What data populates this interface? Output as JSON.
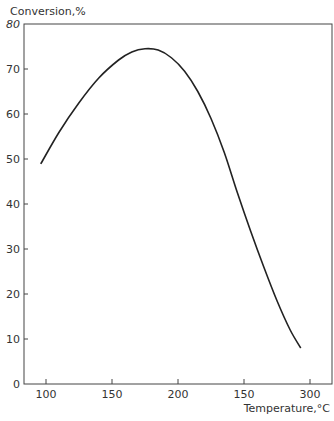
{
  "chart_data": {
    "type": "line",
    "title": "",
    "ylabel": "Conversion,%",
    "xlabel": "Temperature,°C",
    "ylim": [
      0,
      80
    ],
    "xlim": [
      85,
      315
    ],
    "y_ticks": [
      0,
      10,
      20,
      30,
      40,
      50,
      60,
      70,
      80
    ],
    "x_ticks": [
      100,
      150,
      200,
      250,
      300
    ],
    "x_tick_labels": [
      "100",
      "150",
      "200",
      "150",
      "300"
    ],
    "grid": false,
    "legend": null,
    "series": [
      {
        "name": "Conversion",
        "x": [
          96,
          110,
          125,
          140,
          155,
          165,
          175,
          185,
          195,
          205,
          215,
          225,
          235,
          245,
          255,
          265,
          275,
          285,
          293
        ],
        "y": [
          48.9,
          56,
          62.5,
          68,
          72,
          73.8,
          74.5,
          74.2,
          72.5,
          69.5,
          65,
          59,
          51.5,
          42.5,
          34,
          26,
          18.5,
          12,
          8
        ]
      }
    ]
  }
}
